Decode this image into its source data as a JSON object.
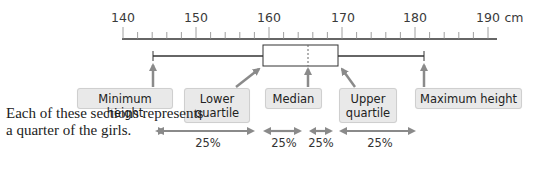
{
  "axis": {
    "unit": "cm",
    "ticks": [
      {
        "value": 140,
        "label": "140"
      },
      {
        "value": 150,
        "label": "150"
      },
      {
        "value": 160,
        "label": "160"
      },
      {
        "value": 170,
        "label": "170"
      },
      {
        "value": 180,
        "label": "180"
      },
      {
        "value": 190,
        "label": "190"
      }
    ]
  },
  "labels": {
    "minimum": "Minimum height",
    "lower_quartile_line1": "Lower",
    "lower_quartile_line2": "quartile",
    "median": "Median",
    "upper_quartile_line1": "Upper",
    "upper_quartile_line2": "quartile",
    "maximum": "Maximum height"
  },
  "caption": "Each of these sections represents a quarter of the girls.",
  "sections": [
    {
      "label": "25%"
    },
    {
      "label": "25%"
    },
    {
      "label": "25%"
    },
    {
      "label": "25%"
    }
  ],
  "box_plot": {
    "minimum": 144,
    "lower_quartile": 159,
    "median": 165,
    "upper_quartile": 169,
    "maximum": 181
  },
  "colors": {
    "arrow": "#8a8a8a",
    "label_bg": "#e9e9e9",
    "axis": "#333333"
  }
}
